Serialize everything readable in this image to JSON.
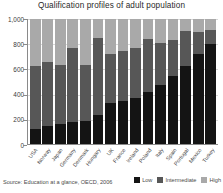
{
  "chart_data": {
    "type": "bar",
    "title": "Qualification profiles of adult population",
    "xlabel": "",
    "ylabel": "",
    "ylim": [
      0,
      1000
    ],
    "yticks": [
      0,
      200,
      400,
      600,
      800,
      1000
    ],
    "ytick_labels": [
      "0",
      "200",
      "400",
      "600",
      "800",
      "1,000"
    ],
    "grid": true,
    "stacked": true,
    "legend_position": "bottom-right",
    "categories": [
      "USA",
      "Norway",
      "Japan",
      "Germany",
      "Denmark",
      "Hungary",
      "UK",
      "France",
      "Ireland",
      "Poland",
      "Italy",
      "Spain",
      "Portugal",
      "Mexico",
      "Turkey"
    ],
    "series": [
      {
        "name": "Low",
        "color": "#141414",
        "values": [
          120,
          145,
          160,
          175,
          185,
          230,
          330,
          345,
          370,
          420,
          470,
          545,
          625,
          720,
          800
        ]
      },
      {
        "name": "Intermediate",
        "color": "#575757",
        "values": [
          505,
          510,
          475,
          590,
          450,
          615,
          390,
          400,
          395,
          420,
          340,
          290,
          275,
          175,
          110
        ]
      },
      {
        "name": "High",
        "color": "#a9a9a9",
        "values": [
          375,
          345,
          365,
          235,
          365,
          155,
          280,
          255,
          235,
          160,
          190,
          165,
          100,
          105,
          90
        ]
      }
    ],
    "source_note": "Source: Education at a glance, OECD, 2006"
  }
}
